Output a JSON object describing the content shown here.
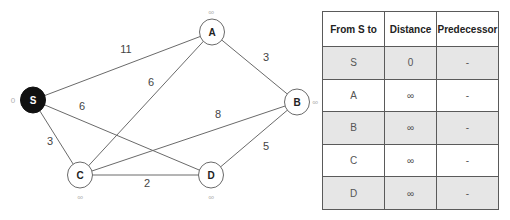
{
  "graph": {
    "nodes": [
      {
        "id": "S",
        "label": "S",
        "x": 33,
        "y": 100,
        "distance": "0",
        "dist_x": 13,
        "dist_y": 100,
        "source": true
      },
      {
        "id": "A",
        "label": "A",
        "x": 212,
        "y": 32,
        "distance": "∞",
        "dist_x": 211,
        "dist_y": 12,
        "source": false
      },
      {
        "id": "B",
        "label": "B",
        "x": 297,
        "y": 102,
        "distance": "∞",
        "dist_x": 315,
        "dist_y": 102,
        "source": false
      },
      {
        "id": "C",
        "label": "C",
        "x": 80,
        "y": 175,
        "distance": "∞",
        "dist_x": 80,
        "dist_y": 197,
        "source": false
      },
      {
        "id": "D",
        "label": "D",
        "x": 211,
        "y": 175,
        "distance": "∞",
        "dist_x": 211,
        "dist_y": 197,
        "source": false
      }
    ],
    "edges": [
      {
        "from": "S",
        "to": "A",
        "weight": "11",
        "lx": 126,
        "ly": 50
      },
      {
        "from": "S",
        "to": "D",
        "weight": "6",
        "lx": 82,
        "ly": 107
      },
      {
        "from": "S",
        "to": "C",
        "weight": "3",
        "lx": 50,
        "ly": 142
      },
      {
        "from": "C",
        "to": "A",
        "weight": "6",
        "lx": 151,
        "ly": 83
      },
      {
        "from": "C",
        "to": "B",
        "weight": "8",
        "lx": 218,
        "ly": 115
      },
      {
        "from": "C",
        "to": "D",
        "weight": "2",
        "lx": 147,
        "ly": 184
      },
      {
        "from": "A",
        "to": "B",
        "weight": "3",
        "lx": 266,
        "ly": 58
      },
      {
        "from": "D",
        "to": "B",
        "weight": "5",
        "lx": 266,
        "ly": 147
      }
    ],
    "node_radius": 12.5
  },
  "table": {
    "headers": [
      "From S to",
      "Distance",
      "Predecessor"
    ],
    "rows": [
      {
        "node": "S",
        "distance": "0",
        "predecessor": "-",
        "shaded": true
      },
      {
        "node": "A",
        "distance": "∞",
        "predecessor": "-",
        "shaded": false
      },
      {
        "node": "B",
        "distance": "∞",
        "predecessor": "-",
        "shaded": true
      },
      {
        "node": "C",
        "distance": "∞",
        "predecessor": "-",
        "shaded": false
      },
      {
        "node": "D",
        "distance": "∞",
        "predecessor": "-",
        "shaded": true
      }
    ]
  }
}
